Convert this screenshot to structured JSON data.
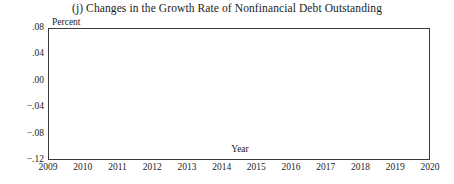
{
  "chart_data": {
    "type": "line",
    "title": "(j)  Changes in the Growth Rate of Nonfinancial Debt Outstanding",
    "xlabel": "Year",
    "ylabel": "Percent",
    "x": [
      2009,
      2010,
      2011,
      2012,
      2013,
      2014,
      2015,
      2016,
      2017,
      2018,
      2019,
      2020
    ],
    "values": [
      0.0,
      0.036,
      0.05,
      0.044,
      0.026,
      0.004,
      -0.044,
      -0.088,
      -0.104,
      -0.106,
      -0.098,
      -0.073
    ],
    "series": [
      {
        "name": "Changes in the Growth Rate of Nonfinancial Debt Outstanding",
        "values": [
          0.0,
          0.036,
          0.05,
          0.044,
          0.026,
          0.004,
          -0.044,
          -0.088,
          -0.104,
          -0.106,
          -0.098,
          -0.073
        ]
      }
    ],
    "xlim": [
      2009,
      2020
    ],
    "ylim": [
      -0.12,
      0.08
    ],
    "yticks": [
      0.08,
      0.04,
      0.0,
      -0.04,
      -0.08,
      -0.12
    ],
    "ytick_labels": [
      ".08",
      ".04",
      ".00",
      "−.04",
      "−.08",
      "−.12"
    ],
    "xticks": [
      2009,
      2010,
      2011,
      2012,
      2013,
      2014,
      2015,
      2016,
      2017,
      2018,
      2019,
      2020
    ],
    "xtick_labels": [
      "2009",
      "2010",
      "2011",
      "2012",
      "2013",
      "2014",
      "2015",
      "2016",
      "2017",
      "2018",
      "2019",
      "2020"
    ],
    "grid": true,
    "legend": "none",
    "zero_line": true,
    "line_color": "#2b2b2b",
    "grid_color": "#ededed",
    "axis_color": "#3a3a3a",
    "background_color": "#ffffff"
  }
}
